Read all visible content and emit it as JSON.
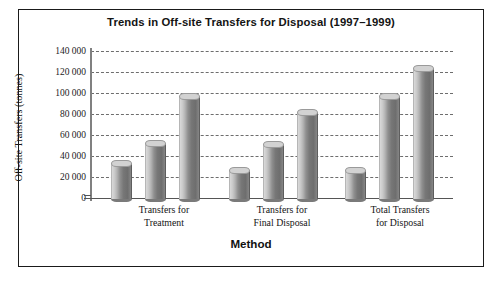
{
  "figure": {
    "title": "Trends in Off-site Transfers for Disposal (1997–1999)",
    "caption": ""
  },
  "chart_data": {
    "type": "bar",
    "title": "Trends in Off-site Transfers for Disposal (1997–1999)",
    "xlabel": "Method",
    "ylabel": "Off-site Transfers (tonnes)",
    "ylim": [
      0,
      140000
    ],
    "ytick_step": 20000,
    "ytick_labels": [
      "140 000",
      "120 000",
      "100 000",
      "80 000",
      "60 000",
      "40 000",
      "20 000",
      "0"
    ],
    "ytick_values": [
      140000,
      120000,
      100000,
      80000,
      60000,
      40000,
      20000,
      0
    ],
    "grid": "horizontal-dashed",
    "legend": "none",
    "categories": [
      "Transfers for Treatment",
      "Transfers for Final Disposal",
      "Total Transfers for Disposal"
    ],
    "category_lines": [
      [
        "Transfers for",
        "Treatment"
      ],
      [
        "Transfers for",
        "Final Disposal"
      ],
      [
        "Total Transfers",
        "for Disposal"
      ]
    ],
    "series": [
      {
        "name": "1997",
        "values": [
          37000,
          30000,
          30000
        ]
      },
      {
        "name": "1998",
        "values": [
          56000,
          55000,
          100000
        ]
      },
      {
        "name": "1999",
        "values": [
          100000,
          85000,
          127000
        ]
      }
    ],
    "series_order_note": "three bars per category, left to right",
    "bars": [
      {
        "category": "Transfers for Treatment",
        "index": 0,
        "value": 37000
      },
      {
        "category": "Transfers for Treatment",
        "index": 1,
        "value": 30000
      },
      {
        "category": "Transfers for Treatment",
        "index": 2,
        "value": 30000
      },
      {
        "category": "Transfers for Final Disposal",
        "index": 0,
        "value": 56000
      },
      {
        "category": "Transfers for Final Disposal",
        "index": 1,
        "value": 55000
      },
      {
        "category": "Transfers for Final Disposal",
        "index": 2,
        "value": 100000
      },
      {
        "category": "Total Transfers for Disposal",
        "index": 0,
        "value": 100000
      },
      {
        "category": "Total Transfers for Disposal",
        "index": 1,
        "value": 85000
      },
      {
        "category": "Total Transfers for Disposal",
        "index": 2,
        "value": 127000
      }
    ],
    "colors": {
      "bar_light": "#d2d2d2",
      "bar_dark": "#6e6e6e",
      "gridline": "#6d6d6d",
      "axis": "#808080",
      "frame": "#1a1a1a",
      "text": "#141414"
    }
  }
}
